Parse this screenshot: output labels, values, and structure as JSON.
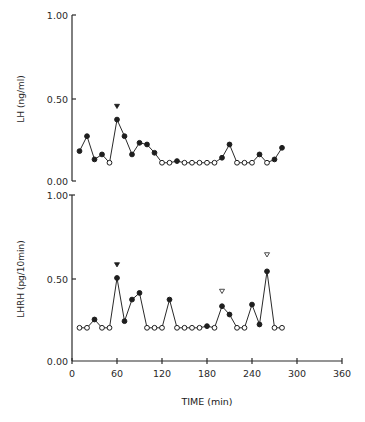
{
  "chart_data": [
    {
      "type": "line",
      "panel": "top",
      "title": "",
      "xlabel": "",
      "ylabel": "LH (ng/ml)",
      "ylim": [
        0,
        1.0
      ],
      "xlim": [
        0,
        360
      ],
      "yticks": [
        "0.00",
        "0.50",
        "1.00"
      ],
      "grid": false,
      "x": [
        10,
        20,
        30,
        40,
        50,
        60,
        70,
        80,
        90,
        100,
        110,
        120,
        130,
        140,
        150,
        160,
        170,
        180,
        190,
        200,
        210,
        220,
        230,
        240,
        250,
        260,
        270,
        280
      ],
      "values": [
        0.18,
        0.27,
        0.13,
        0.16,
        0.11,
        0.37,
        0.27,
        0.16,
        0.23,
        0.22,
        0.17,
        0.11,
        0.11,
        0.12,
        0.11,
        0.11,
        0.11,
        0.11,
        0.11,
        0.14,
        0.22,
        0.11,
        0.11,
        0.11,
        0.16,
        0.11,
        0.13,
        0.2
      ],
      "marker_filled": [
        true,
        true,
        true,
        true,
        false,
        true,
        true,
        true,
        true,
        true,
        true,
        false,
        false,
        true,
        false,
        false,
        false,
        false,
        false,
        true,
        true,
        false,
        false,
        false,
        true,
        false,
        true,
        true
      ],
      "annotations": [
        {
          "x": 60,
          "y": 0.45,
          "marker": "filled-triangle-down"
        }
      ]
    },
    {
      "type": "line",
      "panel": "bottom",
      "title": "",
      "xlabel": "TIME (min)",
      "ylabel": "LHRH (pg/10min)",
      "ylim": [
        0,
        1.0
      ],
      "xlim": [
        0,
        360
      ],
      "xticks": [
        "0",
        "60",
        "120",
        "180",
        "240",
        "300",
        "360"
      ],
      "yticks": [
        "0.00",
        "0.50",
        "1.00"
      ],
      "grid": false,
      "x": [
        10,
        20,
        30,
        40,
        50,
        60,
        70,
        80,
        90,
        100,
        110,
        120,
        130,
        140,
        150,
        160,
        170,
        180,
        190,
        200,
        210,
        220,
        230,
        240,
        250,
        260,
        270,
        280
      ],
      "values": [
        0.2,
        0.2,
        0.25,
        0.2,
        0.2,
        0.5,
        0.24,
        0.37,
        0.41,
        0.2,
        0.2,
        0.2,
        0.37,
        0.2,
        0.2,
        0.2,
        0.2,
        0.21,
        0.2,
        0.33,
        0.28,
        0.2,
        0.2,
        0.34,
        0.22,
        0.54,
        0.2,
        0.2
      ],
      "marker_filled": [
        false,
        false,
        true,
        false,
        false,
        true,
        true,
        true,
        true,
        false,
        false,
        false,
        true,
        false,
        false,
        false,
        false,
        true,
        false,
        true,
        true,
        false,
        false,
        true,
        true,
        true,
        false,
        false
      ],
      "annotations": [
        {
          "x": 60,
          "y": 0.58,
          "marker": "filled-triangle-down"
        },
        {
          "x": 200,
          "y": 0.42,
          "marker": "open-triangle-down"
        },
        {
          "x": 260,
          "y": 0.64,
          "marker": "open-triangle-down"
        }
      ]
    }
  ],
  "labels": {
    "top_ylabel": "LH (ng/ml)",
    "bottom_ylabel": "LHRH (pg/10min)",
    "xlabel": "TIME (min)",
    "top_yticks": [
      "1.00",
      "0.50",
      "0.00"
    ],
    "bottom_yticks": [
      "1.00",
      "0.50",
      "0.00"
    ],
    "xticks": [
      "0",
      "60",
      "120",
      "180",
      "240",
      "300",
      "360"
    ]
  }
}
